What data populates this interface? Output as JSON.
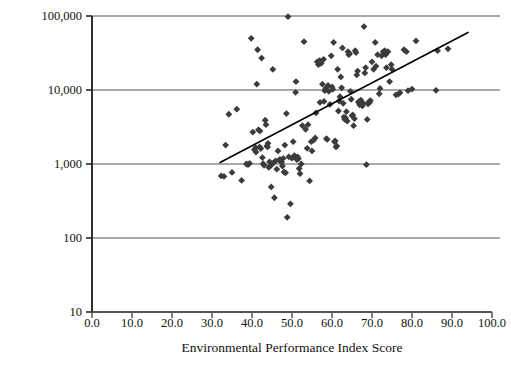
{
  "chart_data": {
    "type": "scatter",
    "title": "",
    "xlabel": "Environmental Performance Index Score",
    "ylabel": "Per Capita Income (2007 Dollars)",
    "xlim": [
      0.0,
      100.0
    ],
    "ylim": [
      10,
      100000
    ],
    "yscale": "log",
    "xscale": "linear",
    "grid": "horizontal",
    "legend": "none",
    "xticks": [
      "0.0",
      "10.0",
      "20.0",
      "30.0",
      "40.0",
      "50.0",
      "60.0",
      "70.0",
      "80.0",
      "90.0",
      "100.0"
    ],
    "xtick_values": [
      0,
      10,
      20,
      30,
      40,
      50,
      60,
      70,
      80,
      90,
      100
    ],
    "yticks": [
      "10",
      "100",
      "1,000",
      "10,000",
      "100,000"
    ],
    "ytick_values": [
      10,
      100,
      1000,
      10000,
      100000
    ],
    "marker": "diamond",
    "marker_color": "#3b3b3b",
    "marker_size": 3.4,
    "gridline_color": "#8c8c8c",
    "axis_color": "#1a1a1a",
    "trendline": {
      "color": "#000000",
      "width": 1.6,
      "x_start": 32.0,
      "y_start": 1050,
      "x_end": 94.0,
      "y_end": 60000
    },
    "points": [
      [
        32.3,
        690
      ],
      [
        33.0,
        680
      ],
      [
        33.4,
        1800
      ],
      [
        34.2,
        4700
      ],
      [
        35.0,
        770
      ],
      [
        36.2,
        5500
      ],
      [
        37.4,
        600
      ],
      [
        38.6,
        1000
      ],
      [
        39.0,
        980
      ],
      [
        39.4,
        1020
      ],
      [
        39.8,
        50000
      ],
      [
        40.2,
        2700
      ],
      [
        40.6,
        1560
      ],
      [
        40.9,
        1660
      ],
      [
        41.0,
        1450
      ],
      [
        41.2,
        12000
      ],
      [
        41.4,
        35000
      ],
      [
        41.6,
        2900
      ],
      [
        41.9,
        1700
      ],
      [
        42.0,
        2800
      ],
      [
        42.2,
        1620
      ],
      [
        42.4,
        27000
      ],
      [
        42.6,
        1220
      ],
      [
        42.8,
        1010
      ],
      [
        43.0,
        960
      ],
      [
        43.3,
        3900
      ],
      [
        43.5,
        3400
      ],
      [
        43.7,
        1750
      ],
      [
        43.9,
        1700
      ],
      [
        44.0,
        1900
      ],
      [
        44.2,
        900
      ],
      [
        44.4,
        1070
      ],
      [
        44.6,
        950
      ],
      [
        44.8,
        490
      ],
      [
        45.0,
        1000
      ],
      [
        45.2,
        19000
      ],
      [
        45.4,
        1040
      ],
      [
        45.6,
        350
      ],
      [
        45.9,
        1100
      ],
      [
        46.2,
        850
      ],
      [
        46.5,
        1500
      ],
      [
        46.8,
        1130
      ],
      [
        47.0,
        1150
      ],
      [
        47.2,
        1080
      ],
      [
        47.4,
        1060
      ],
      [
        47.6,
        940
      ],
      [
        47.8,
        1190
      ],
      [
        48.0,
        780
      ],
      [
        48.2,
        1800
      ],
      [
        48.4,
        760
      ],
      [
        48.6,
        4800
      ],
      [
        48.8,
        190
      ],
      [
        49.0,
        98000
      ],
      [
        49.2,
        1250
      ],
      [
        49.6,
        290
      ],
      [
        50.0,
        1200
      ],
      [
        50.3,
        2000
      ],
      [
        50.6,
        1300
      ],
      [
        50.9,
        9300
      ],
      [
        51.0,
        13000
      ],
      [
        51.2,
        1150
      ],
      [
        51.4,
        1250
      ],
      [
        51.6,
        1180
      ],
      [
        51.8,
        870
      ],
      [
        52.0,
        740
      ],
      [
        52.3,
        1000
      ],
      [
        52.6,
        3300
      ],
      [
        53.0,
        45000
      ],
      [
        53.4,
        2950
      ],
      [
        53.8,
        1630
      ],
      [
        54.0,
        3400
      ],
      [
        54.4,
        590
      ],
      [
        54.8,
        2000
      ],
      [
        55.0,
        1500
      ],
      [
        55.4,
        2100
      ],
      [
        55.8,
        2250
      ],
      [
        56.0,
        4900
      ],
      [
        56.3,
        24000
      ],
      [
        56.6,
        22000
      ],
      [
        56.9,
        25000
      ],
      [
        57.0,
        6800
      ],
      [
        57.3,
        23000
      ],
      [
        57.6,
        12000
      ],
      [
        57.9,
        26000
      ],
      [
        58.0,
        7000
      ],
      [
        58.2,
        9800
      ],
      [
        58.4,
        10500
      ],
      [
        58.6,
        2200
      ],
      [
        58.8,
        2150
      ],
      [
        59.0,
        11500
      ],
      [
        59.2,
        9600
      ],
      [
        59.5,
        6400
      ],
      [
        59.8,
        29000
      ],
      [
        60.0,
        11000
      ],
      [
        60.2,
        10200
      ],
      [
        60.4,
        44000
      ],
      [
        60.6,
        2000
      ],
      [
        60.8,
        2050
      ],
      [
        61.0,
        1700
      ],
      [
        61.2,
        1750
      ],
      [
        61.4,
        19000
      ],
      [
        61.6,
        5200
      ],
      [
        61.8,
        7100
      ],
      [
        62.0,
        8100
      ],
      [
        62.2,
        15000
      ],
      [
        62.4,
        10700
      ],
      [
        62.6,
        37000
      ],
      [
        62.8,
        6600
      ],
      [
        63.0,
        4300
      ],
      [
        63.2,
        4000
      ],
      [
        63.4,
        4200
      ],
      [
        63.6,
        5100
      ],
      [
        63.8,
        3800
      ],
      [
        64.0,
        33000
      ],
      [
        64.2,
        30000
      ],
      [
        64.4,
        31000
      ],
      [
        64.6,
        9600
      ],
      [
        64.8,
        7500
      ],
      [
        65.0,
        4500
      ],
      [
        65.2,
        4600
      ],
      [
        65.4,
        3300
      ],
      [
        65.6,
        4100
      ],
      [
        65.8,
        34000
      ],
      [
        66.0,
        32000
      ],
      [
        66.2,
        16000
      ],
      [
        66.4,
        18000
      ],
      [
        66.6,
        6900
      ],
      [
        66.8,
        6700
      ],
      [
        66.9,
        6300
      ],
      [
        67.0,
        6500
      ],
      [
        67.2,
        7300
      ],
      [
        67.4,
        6800
      ],
      [
        67.6,
        6100
      ],
      [
        67.8,
        6600
      ],
      [
        68.0,
        72000
      ],
      [
        68.2,
        17000
      ],
      [
        68.4,
        20000
      ],
      [
        68.6,
        980
      ],
      [
        68.8,
        4000
      ],
      [
        69.0,
        6500
      ],
      [
        69.2,
        6900
      ],
      [
        69.4,
        6800
      ],
      [
        69.6,
        7200
      ],
      [
        70.0,
        24000
      ],
      [
        70.4,
        19000
      ],
      [
        70.8,
        44000
      ],
      [
        71.0,
        21000
      ],
      [
        71.4,
        30000
      ],
      [
        71.8,
        8900
      ],
      [
        72.0,
        10500
      ],
      [
        72.4,
        29000
      ],
      [
        72.8,
        33000
      ],
      [
        73.0,
        31000
      ],
      [
        73.2,
        34000
      ],
      [
        73.4,
        30000
      ],
      [
        73.6,
        20000
      ],
      [
        74.0,
        33000
      ],
      [
        74.4,
        13000
      ],
      [
        74.8,
        22000
      ],
      [
        75.0,
        19000
      ],
      [
        76.0,
        8600
      ],
      [
        76.6,
        8800
      ],
      [
        77.0,
        9200
      ],
      [
        78.0,
        35000
      ],
      [
        78.6,
        33000
      ],
      [
        79.0,
        9800
      ],
      [
        80.0,
        10300
      ],
      [
        81.0,
        46000
      ],
      [
        86.0,
        9900
      ],
      [
        86.4,
        34000
      ],
      [
        89.0,
        36000
      ]
    ]
  },
  "axis_titles": {
    "x": "Environmental Performance Index Score",
    "y": "Per Capita Income (2007 Dollars)"
  }
}
